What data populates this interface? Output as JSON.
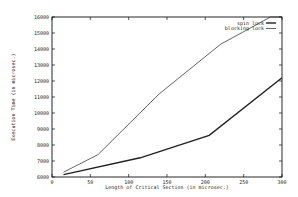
{
  "chart_data": {
    "type": "line",
    "title": "",
    "xlabel": "Length of Critical Section (in microsec.)",
    "ylabel": "Execution Time (in microsec.)",
    "xlim": [
      0,
      300
    ],
    "ylim": [
      6000,
      16000
    ],
    "xticks": [
      0,
      50,
      100,
      150,
      200,
      250,
      300
    ],
    "yticks": [
      6000,
      7000,
      8000,
      9000,
      10000,
      11000,
      12000,
      13000,
      14000,
      15000,
      16000
    ],
    "grid": false,
    "legend_position": "top-right",
    "series": [
      {
        "name": "spin lock",
        "style": "thick",
        "x": [
          15,
          115,
          205,
          300
        ],
        "y": [
          6150,
          7200,
          8600,
          12200
        ]
      },
      {
        "name": "blocking lock",
        "style": "thin",
        "x": [
          15,
          60,
          140,
          220,
          285,
          300
        ],
        "y": [
          6300,
          7400,
          11200,
          14300,
          16000,
          16000
        ]
      }
    ]
  }
}
